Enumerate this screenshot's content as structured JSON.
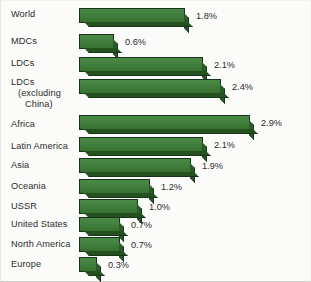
{
  "chart_data": {
    "type": "bar",
    "orientation": "horizontal",
    "title": "",
    "subtitle": "",
    "xlabel": "",
    "ylabel": "",
    "xlim": [
      0,
      3.0
    ],
    "grid": false,
    "legend": null,
    "value_suffix": "%",
    "categories": [
      "World",
      "MDCs",
      "LDCs",
      "LDCs (excluding China)",
      "Africa",
      "Latin America",
      "Asia",
      "Oceania",
      "USSR",
      "United States",
      "North America",
      "Europe"
    ],
    "values": [
      1.8,
      0.6,
      2.1,
      2.4,
      2.9,
      2.1,
      1.9,
      1.2,
      1.0,
      0.7,
      0.7,
      0.3
    ],
    "data_labels": [
      "1.8%",
      "0.6%",
      "2.1%",
      "2.4%",
      "2.9%",
      "2.1%",
      "1.9%",
      "1.2%",
      "1.0%",
      "0.7%",
      "0.7%",
      "0.3%"
    ],
    "series": [
      {
        "name": "Annual growth rate",
        "values": [
          1.8,
          0.6,
          2.1,
          2.4,
          2.9,
          2.1,
          1.9,
          1.2,
          1.0,
          0.7,
          0.7,
          0.3
        ]
      }
    ],
    "bar_color": "#3f7a3c",
    "bar_edge_color": "#17331a",
    "background_color": "#fbfbf9",
    "text_color": "#2b2b2b"
  },
  "rows": [
    {
      "label": "World",
      "label_lines": [
        "World"
      ],
      "value_label": "1.8%",
      "value": 1.8
    },
    {
      "label": "MDCs",
      "label_lines": [
        "MDCs"
      ],
      "value_label": "0.6%",
      "value": 0.6
    },
    {
      "label": "LDCs",
      "label_lines": [
        "LDCs"
      ],
      "value_label": "2.1%",
      "value": 2.1
    },
    {
      "label": "LDCs (excluding China)",
      "label_lines": [
        "LDCs",
        "(excluding",
        "China)"
      ],
      "value_label": "2.4%",
      "value": 2.4
    },
    {
      "label": "Africa",
      "label_lines": [
        "Africa"
      ],
      "value_label": "2.9%",
      "value": 2.9
    },
    {
      "label": "Latin America",
      "label_lines": [
        "Latin America"
      ],
      "value_label": "2.1%",
      "value": 2.1
    },
    {
      "label": "Asia",
      "label_lines": [
        "Asia"
      ],
      "value_label": "1.9%",
      "value": 1.9
    },
    {
      "label": "Oceania",
      "label_lines": [
        "Oceania"
      ],
      "value_label": "1.2%",
      "value": 1.2
    },
    {
      "label": "USSR",
      "label_lines": [
        "USSR"
      ],
      "value_label": "1.0%",
      "value": 1.0
    },
    {
      "label": "United States",
      "label_lines": [
        "United States"
      ],
      "value_label": "0.7%",
      "value": 0.7
    },
    {
      "label": "North America",
      "label_lines": [
        "North America"
      ],
      "value_label": "0.7%",
      "value": 0.7
    },
    {
      "label": "Europe",
      "label_lines": [
        "Europe"
      ],
      "value_label": "0.3%",
      "value": 0.3
    }
  ]
}
